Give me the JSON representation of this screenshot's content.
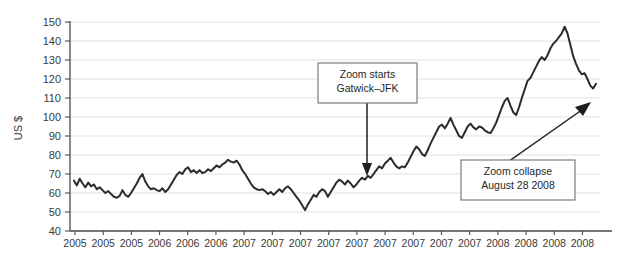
{
  "chart_data": {
    "type": "line",
    "title": "",
    "xlabel": "",
    "ylabel": "US $",
    "ylim": [
      40,
      150
    ],
    "ytick_step": 10,
    "yticks": [
      40,
      50,
      60,
      70,
      80,
      90,
      100,
      110,
      120,
      130,
      140,
      150
    ],
    "grid": true,
    "legend_position": "none",
    "line_color": "#2b2b2b",
    "grid_color": "#e2e2e2",
    "axis_color": "#4a4a4a",
    "xtick_labels": [
      "2005",
      "2005",
      "2005",
      "2006",
      "2006",
      "2006",
      "2007",
      "2007",
      "2007",
      "2007",
      "2007",
      "2007",
      "2007",
      "2007",
      "2007",
      "2008",
      "2008",
      "2008",
      "2008"
    ],
    "series": [
      {
        "name": "US $",
        "values": [
          66.5,
          64.0,
          67.5,
          65.0,
          63.0,
          65.5,
          63.5,
          64.5,
          62.0,
          63.0,
          61.5,
          60.0,
          61.0,
          59.5,
          58.0,
          57.5,
          58.5,
          61.5,
          59.0,
          58.0,
          60.0,
          62.5,
          65.0,
          68.0,
          70.0,
          66.0,
          63.5,
          62.0,
          62.5,
          61.5,
          61.0,
          62.5,
          60.5,
          62.0,
          64.5,
          67.0,
          69.5,
          71.0,
          70.0,
          72.5,
          73.5,
          71.0,
          72.0,
          70.5,
          72.0,
          70.5,
          71.0,
          72.5,
          71.5,
          73.0,
          74.5,
          73.5,
          75.0,
          76.0,
          77.5,
          76.5,
          76.0,
          77.0,
          75.0,
          72.0,
          70.0,
          67.5,
          65.0,
          63.0,
          62.0,
          61.5,
          62.0,
          61.0,
          59.5,
          60.5,
          59.0,
          60.5,
          62.0,
          60.5,
          62.5,
          63.5,
          62.0,
          60.0,
          58.0,
          56.0,
          53.5,
          51.0,
          54.0,
          56.5,
          59.0,
          58.0,
          60.5,
          62.0,
          61.0,
          58.0,
          60.5,
          63.0,
          65.5,
          67.0,
          66.0,
          64.5,
          66.5,
          65.0,
          63.0,
          64.5,
          66.5,
          68.0,
          67.0,
          69.0,
          68.0,
          70.0,
          72.0,
          74.0,
          73.0,
          75.5,
          77.0,
          78.5,
          76.0,
          74.0,
          73.0,
          74.0,
          73.5,
          76.0,
          79.0,
          82.0,
          84.5,
          83.0,
          80.5,
          79.5,
          82.5,
          86.0,
          89.0,
          92.0,
          95.0,
          96.0,
          94.0,
          96.5,
          99.5,
          96.0,
          93.0,
          90.0,
          89.0,
          92.0,
          95.0,
          96.5,
          94.5,
          93.5,
          95.0,
          94.5,
          93.0,
          92.0,
          91.5,
          94.0,
          97.0,
          101.0,
          105.0,
          108.5,
          110.0,
          106.0,
          102.5,
          101.0,
          105.0,
          110.0,
          114.5,
          119.0,
          120.5,
          123.5,
          126.5,
          129.5,
          131.5,
          130.0,
          132.5,
          136.0,
          138.5,
          140.0,
          142.0,
          144.0,
          147.5,
          144.0,
          138.0,
          132.0,
          128.0,
          124.5,
          122.5,
          123.0,
          120.0,
          116.5,
          115.0,
          117.5
        ]
      }
    ],
    "annotations": [
      {
        "id": "zoom-starts",
        "line1": "Zoom starts",
        "line2": "Gatwick–JFK",
        "arrow": "down",
        "target_value": 70
      },
      {
        "id": "zoom-collapse",
        "line1": "Zoom collapse",
        "line2": "August 28 2008",
        "arrow": "up-right",
        "target_value": 115
      }
    ]
  }
}
